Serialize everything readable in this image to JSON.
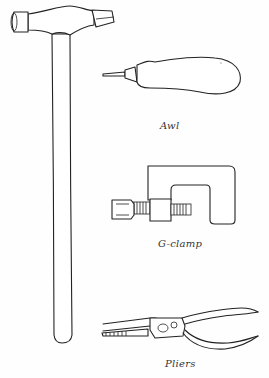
{
  "figure": {
    "type": "line-illustration",
    "ink_color": "#222222",
    "background": "#ffffff",
    "tools": [
      {
        "id": "hammer",
        "label": ""
      },
      {
        "id": "awl",
        "label": "Awl"
      },
      {
        "id": "gclamp",
        "label": "G-clamp"
      },
      {
        "id": "pliers",
        "label": "Pliers"
      }
    ]
  }
}
